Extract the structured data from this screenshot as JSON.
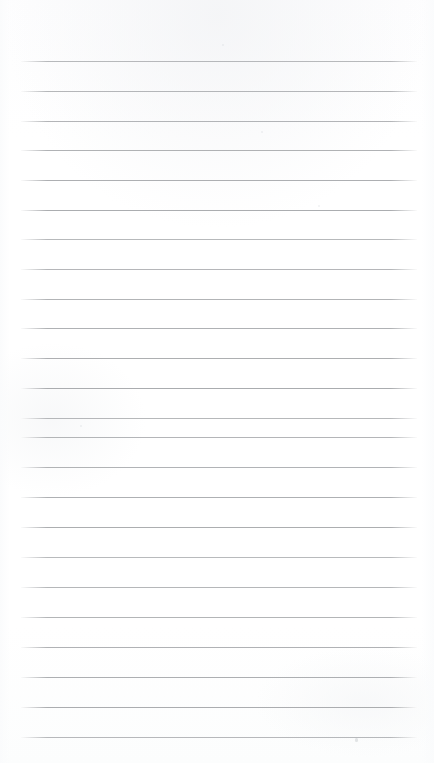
{
  "document": {
    "kind": "scanned-blank-ruled-page",
    "title": "",
    "body_text": "",
    "width_px": 434,
    "height_px": 763,
    "background_color": "#ffffff",
    "has_text_content": false,
    "has_handwriting": false,
    "has_margin_rule": false
  },
  "ruling": {
    "line_color": "#a7a9ac",
    "line_thickness_px": 1,
    "line_count": 24,
    "line_left_px": 21,
    "line_right_px": 417,
    "line_length_px": 396,
    "first_line_y_px": 61,
    "last_line_y_px": 737,
    "line_spacing_px": 29.8,
    "top_margin_px": 61,
    "bottom_margin_px": 26,
    "left_margin_px": 21,
    "right_margin_px": 17,
    "line_positions_y": [
      61,
      91,
      121,
      150,
      180,
      210,
      239,
      269,
      299,
      328,
      358,
      388,
      418,
      437,
      467,
      497,
      527,
      557,
      587,
      617,
      647,
      677,
      707,
      737
    ]
  },
  "artifacts": {
    "specks": [
      {
        "x": 355,
        "y": 738,
        "w": 3,
        "h": 4
      },
      {
        "x": 80,
        "y": 425,
        "w": 2,
        "h": 2
      },
      {
        "x": 222,
        "y": 44,
        "w": 2,
        "h": 2
      },
      {
        "x": 261,
        "y": 131,
        "w": 2,
        "h": 2
      },
      {
        "x": 318,
        "y": 205,
        "w": 2,
        "h": 2
      }
    ]
  }
}
